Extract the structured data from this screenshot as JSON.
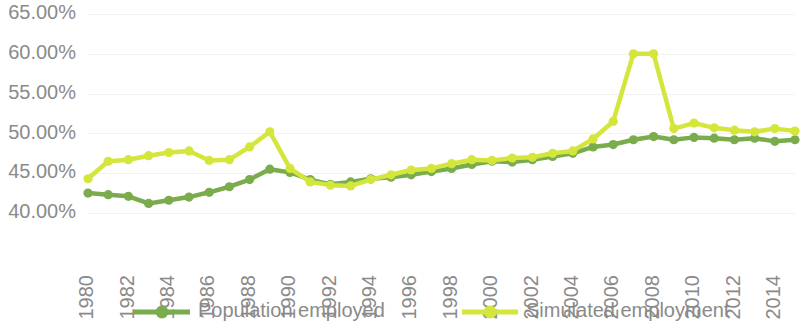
{
  "chart_data": {
    "type": "line",
    "title": "",
    "subtitle": "",
    "xlabel": "",
    "ylabel": "",
    "ylim": [
      40,
      65
    ],
    "ytick_labels": [
      "65.00%",
      "60.00%",
      "55.00%",
      "50.00%",
      "45.00%",
      "40.00%"
    ],
    "ytick_values": [
      65,
      60,
      55,
      50,
      45,
      40
    ],
    "grid": true,
    "grid_axis": "y",
    "legend_position": "bottom",
    "x": [
      1980,
      1981,
      1982,
      1983,
      1984,
      1985,
      1986,
      1987,
      1988,
      1989,
      1990,
      1991,
      1992,
      1993,
      1994,
      1995,
      1996,
      1997,
      1998,
      1999,
      2000,
      2001,
      2002,
      2003,
      2004,
      2005,
      2006,
      2007,
      2008,
      2009,
      2010,
      2011,
      2012,
      2013,
      2014,
      2015
    ],
    "xtick_labels": [
      "1980",
      "1982",
      "1984",
      "1986",
      "1988",
      "1990",
      "1992",
      "1994",
      "1996",
      "1998",
      "2000",
      "2002",
      "2004",
      "2006",
      "2008",
      "2010",
      "2012",
      "2014"
    ],
    "xtick_values": [
      1980,
      1982,
      1984,
      1986,
      1988,
      1990,
      1992,
      1994,
      1996,
      1998,
      2000,
      2002,
      2004,
      2006,
      2008,
      2010,
      2012,
      2014
    ],
    "series": [
      {
        "name": "Population employed",
        "color": "#7aac4e",
        "values": [
          42.5,
          42.3,
          42.1,
          41.2,
          41.6,
          42.0,
          42.6,
          43.3,
          44.2,
          45.5,
          45.1,
          44.2,
          43.6,
          43.9,
          44.3,
          44.5,
          44.8,
          45.2,
          45.6,
          46.1,
          46.5,
          46.4,
          46.7,
          47.1,
          47.5,
          48.3,
          48.6,
          49.2,
          49.6,
          49.2,
          49.5,
          49.4,
          49.2,
          49.4,
          49.0,
          49.2
        ]
      },
      {
        "name": "Simulated employment",
        "color": "#d4e63c",
        "values": [
          44.3,
          46.5,
          46.7,
          47.2,
          47.6,
          47.8,
          46.6,
          46.7,
          48.3,
          50.2,
          45.6,
          43.9,
          43.5,
          43.4,
          44.2,
          44.8,
          45.4,
          45.6,
          46.2,
          46.7,
          46.6,
          46.9,
          47.0,
          47.5,
          47.8,
          49.3,
          51.5,
          60.0,
          60.0,
          50.6,
          51.3,
          50.7,
          50.4,
          50.2,
          50.6,
          50.3
        ]
      }
    ]
  },
  "legend": {
    "items": [
      {
        "label": "Population employed",
        "color": "#7aac4e"
      },
      {
        "label": "Simulated employment",
        "color": "#d4e63c"
      }
    ]
  }
}
